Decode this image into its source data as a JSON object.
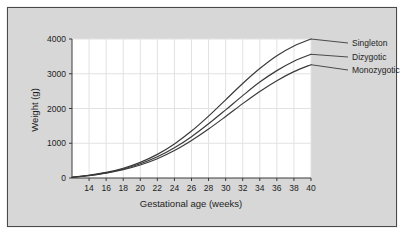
{
  "figure": {
    "background_color": "#d7d7d7",
    "plot_background_color": "#ffffff",
    "frame_color": "#4a4a4a",
    "grid_color": "#e2e2e2",
    "curve_color": "#3a3a3a"
  },
  "chart_data": {
    "type": "line",
    "title": "",
    "subtitle": "",
    "xlabel": "Gestational age (weeks)",
    "ylabel": "Weight (g)",
    "xlim": [
      12,
      40
    ],
    "ylim": [
      0,
      4000
    ],
    "xticks": [
      14,
      16,
      18,
      20,
      22,
      24,
      26,
      28,
      30,
      32,
      34,
      36,
      38,
      40
    ],
    "yticks": [
      0,
      1000,
      2000,
      3000,
      4000
    ],
    "xtick_labels": [
      "14",
      "16",
      "18",
      "20",
      "22",
      "24",
      "26",
      "28",
      "30",
      "32",
      "34",
      "36",
      "38",
      "40"
    ],
    "ytick_labels": [
      "0",
      "1000",
      "2000",
      "3000",
      "4000"
    ],
    "grid": true,
    "legend_position": "right-inline-labels",
    "x": [
      12,
      14,
      16,
      18,
      20,
      22,
      24,
      26,
      28,
      30,
      32,
      34,
      36,
      38,
      40
    ],
    "series": [
      {
        "name": "Singleton",
        "label": "Singleton",
        "values": [
          20,
          80,
          160,
          280,
          450,
          680,
          980,
          1350,
          1780,
          2250,
          2720,
          3150,
          3520,
          3800,
          4000
        ]
      },
      {
        "name": "Dizygotic",
        "label": "Dizygotic",
        "values": [
          20,
          75,
          150,
          260,
          410,
          610,
          870,
          1190,
          1560,
          1960,
          2370,
          2760,
          3090,
          3360,
          3560
        ]
      },
      {
        "name": "Monozygotic",
        "label": "Monozygotic",
        "values": [
          20,
          70,
          140,
          240,
          375,
          555,
          790,
          1080,
          1410,
          1770,
          2140,
          2490,
          2800,
          3060,
          3260
        ]
      }
    ]
  }
}
